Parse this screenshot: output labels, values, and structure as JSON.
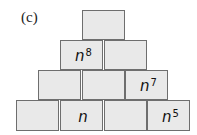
{
  "label": "(c)",
  "pyramid": {
    "rows": [
      [
        {
          "base": "",
          "exp": ""
        }
      ],
      [
        {
          "base": "n",
          "exp": "8"
        },
        {
          "base": "",
          "exp": ""
        }
      ],
      [
        {
          "base": "",
          "exp": ""
        },
        {
          "base": "",
          "exp": ""
        },
        {
          "base": "n",
          "exp": "7"
        }
      ],
      [
        {
          "base": "",
          "exp": ""
        },
        {
          "base": "n",
          "exp": ""
        },
        {
          "base": "",
          "exp": ""
        },
        {
          "base": "n",
          "exp": "5"
        }
      ]
    ]
  },
  "colors": {
    "cell_fill": "#e9e9e9",
    "cell_border": "#6e6e6e"
  }
}
